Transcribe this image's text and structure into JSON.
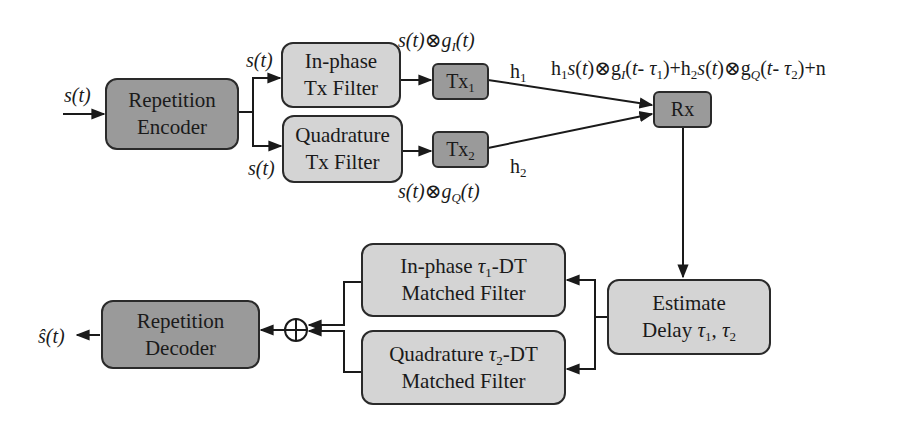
{
  "blocks": {
    "rep_encoder": {
      "line1": "Repetition",
      "line2": "Encoder"
    },
    "inphase_tx": {
      "line1": "In-phase",
      "line2": "Tx Filter"
    },
    "quad_tx": {
      "line1": "Quadrature",
      "line2": "Tx Filter"
    },
    "tx1": {
      "base": "Tx",
      "sub": "1"
    },
    "tx2": {
      "base": "Tx",
      "sub": "2"
    },
    "rx": {
      "label": "Rx"
    },
    "estimate": {
      "line1": "Estimate",
      "line2a": "Delay ",
      "tau": "τ",
      "sub1": "1",
      "sep": ", ",
      "sub2": "2"
    },
    "inphase_mf": {
      "line1a": "In-phase ",
      "tau": "τ",
      "sub": "1",
      "line1b": "-DT",
      "line2": "Matched Filter"
    },
    "quad_mf": {
      "line1a": "Quadrature ",
      "tau": "τ",
      "sub": "2",
      "line1b": "-DT",
      "line2": "Matched Filter"
    },
    "rep_decoder": {
      "line1": "Repetition",
      "line2": "Decoder"
    }
  },
  "labels": {
    "input": "s(t)",
    "s_top": "s(t)",
    "s_bottom": "s(t)",
    "conv_i": {
      "pre": "s(t)⊗g",
      "sub": "I",
      "post": "(t)"
    },
    "conv_q": {
      "pre": "s(t)⊗g",
      "sub": "Q",
      "post": "(t)"
    },
    "h1": {
      "base": "h",
      "sub": "1"
    },
    "h2": {
      "base": "h",
      "sub": "2"
    },
    "received": "h1s(t)⊗gI(t- τ1)+h2s(t)⊗gQ(t- τ2)+n",
    "output": "ŝ(t)",
    "sum_symbol": "⊕"
  },
  "colors": {
    "dark_block": "#9a9a9a",
    "light_block": "#d4d4d4",
    "line": "#1a1a1a"
  }
}
